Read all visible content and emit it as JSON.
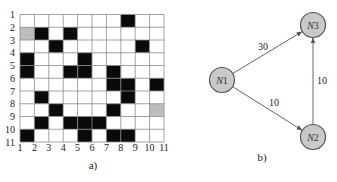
{
  "panel_a": {
    "caption": "a)",
    "cols": 10,
    "rows": 10,
    "x_tick_labels": [
      "1",
      "2",
      "3",
      "4",
      "5",
      "6",
      "7",
      "8",
      "9",
      "10",
      "11"
    ],
    "y_tick_labels": [
      "1",
      "2",
      "3",
      "4",
      "5",
      "6",
      "7",
      "8",
      "9",
      "10",
      "11"
    ],
    "colors": {
      "obstacle": "#0a0a0a",
      "free": "#ffffff",
      "special": "#bdbdbd",
      "grid_line": "#8a8a8a"
    },
    "cells": [
      [
        0,
        0,
        0,
        0,
        0,
        0,
        0,
        1,
        0,
        0
      ],
      [
        2,
        1,
        0,
        1,
        0,
        0,
        0,
        0,
        0,
        0
      ],
      [
        0,
        0,
        1,
        0,
        0,
        0,
        0,
        0,
        1,
        0
      ],
      [
        1,
        0,
        0,
        0,
        1,
        0,
        0,
        0,
        0,
        0
      ],
      [
        1,
        0,
        0,
        1,
        1,
        0,
        1,
        0,
        0,
        0
      ],
      [
        0,
        0,
        0,
        0,
        0,
        0,
        1,
        1,
        0,
        1
      ],
      [
        0,
        1,
        0,
        0,
        0,
        0,
        0,
        1,
        0,
        0
      ],
      [
        0,
        0,
        1,
        0,
        0,
        0,
        1,
        0,
        0,
        2
      ],
      [
        0,
        1,
        0,
        1,
        1,
        1,
        0,
        0,
        0,
        0
      ],
      [
        1,
        0,
        0,
        0,
        1,
        0,
        1,
        1,
        0,
        0
      ]
    ],
    "legend": {
      "0": "free",
      "1": "obstacle",
      "2": "start/goal (gray)"
    }
  },
  "panel_b": {
    "caption": "b)",
    "node_fill": "#c9c9c9",
    "node_stroke": "#555555",
    "edge_color": "#666666",
    "nodes": [
      {
        "id": "N1",
        "prefix": "N",
        "num": "1",
        "x": 222,
        "y": 80
      },
      {
        "id": "N2",
        "prefix": "N",
        "num": "2",
        "x": 313,
        "y": 137
      },
      {
        "id": "N3",
        "prefix": "N",
        "num": "3",
        "x": 313,
        "y": 25
      }
    ],
    "edges": [
      {
        "from": "N1",
        "to": "N3",
        "weight": "30",
        "label_x": 263,
        "label_y": 50
      },
      {
        "from": "N1",
        "to": "N2",
        "weight": "10",
        "label_x": 274,
        "label_y": 106
      },
      {
        "from": "N2",
        "to": "N3",
        "weight": "10",
        "label_x": 322,
        "label_y": 84
      }
    ]
  }
}
